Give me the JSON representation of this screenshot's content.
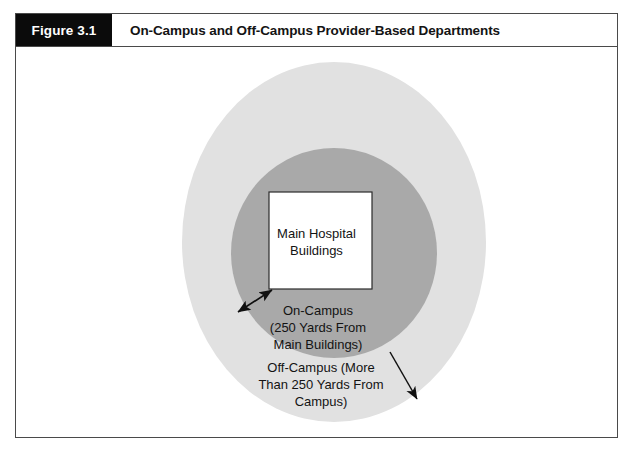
{
  "figure": {
    "number_label": "Figure 3.1",
    "title": "On-Campus and Off-Campus Provider-Based Departments"
  },
  "diagram": {
    "type": "concentric-zone-diagram",
    "inner_box": {
      "name": "main-hospital-buildings",
      "lines": [
        "Main Hospital",
        "Buildings"
      ],
      "fill": "#ffffff",
      "stroke": "#2b2b2b"
    },
    "zones": [
      {
        "name": "on-campus-zone",
        "lines": [
          "On-Campus",
          "(250 Yards From",
          "Main Buildings)"
        ],
        "fill": "#a9a9a9",
        "shape": "circle"
      },
      {
        "name": "off-campus-zone",
        "lines": [
          "Off-Campus (More",
          "Than 250 Yards From",
          "Campus)"
        ],
        "fill": "#e1e1e1",
        "shape": "circle"
      }
    ],
    "annotations": [
      {
        "name": "on-campus-distance-arrow",
        "style": "double-headed",
        "description": "arrow between on-campus ring edge and main hospital buildings"
      },
      {
        "name": "off-campus-pointer-arrow",
        "style": "single-headed",
        "description": "arrow pointing into the off-campus ring"
      }
    ]
  },
  "colors": {
    "header_box_bg": "#0b0b0b",
    "header_box_text": "#ffffff",
    "frame_border": "#4a4a4a",
    "outer_circle": "#e1e1e1",
    "inner_circle": "#a9a9a9",
    "box_fill": "#ffffff",
    "text": "#131313"
  }
}
